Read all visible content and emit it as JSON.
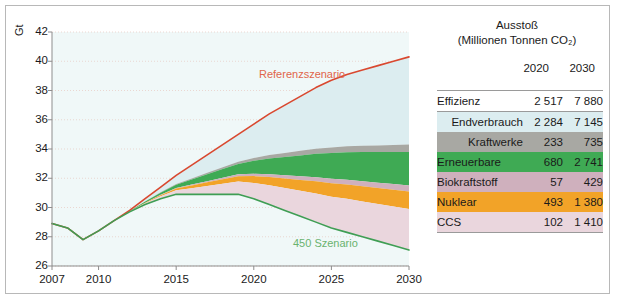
{
  "chart_data": {
    "type": "area",
    "title": "",
    "xlabel": "",
    "ylabel": "Gt",
    "xlim": [
      2007,
      2030
    ],
    "ylim": [
      26,
      42
    ],
    "grid": true,
    "legend_position": "inline-annotations",
    "xticks": [
      "2007",
      "2010",
      "2015",
      "2020",
      "2025",
      "2030"
    ],
    "yticks": [
      "42",
      "40",
      "38",
      "36",
      "34",
      "32",
      "30",
      "28",
      "26"
    ],
    "annotations": [
      {
        "text": "Referenzszenario",
        "color": "#e0654a"
      },
      {
        "text": "450 Szenario",
        "color": "#6ab36f"
      }
    ],
    "x": [
      2007,
      2008,
      2009,
      2010,
      2011,
      2012,
      2013,
      2014,
      2015,
      2016,
      2017,
      2018,
      2019,
      2020,
      2021,
      2022,
      2023,
      2024,
      2025,
      2026,
      2027,
      2028,
      2029,
      2030
    ],
    "series": [
      {
        "name": "Referenzszenario",
        "color": "#d9482f",
        "values": [
          28.9,
          28.6,
          27.8,
          28.4,
          29.1,
          29.8,
          30.6,
          31.4,
          32.2,
          32.9,
          33.6,
          34.3,
          35.0,
          35.7,
          36.4,
          37.0,
          37.6,
          38.2,
          38.7,
          39.1,
          39.4,
          39.7,
          40.0,
          40.3
        ]
      },
      {
        "name": "450 Szenario",
        "color": "#3f9e54",
        "values": [
          28.9,
          28.6,
          27.8,
          28.4,
          29.1,
          29.7,
          30.2,
          30.6,
          30.9,
          30.9,
          30.9,
          30.9,
          30.9,
          30.6,
          30.2,
          29.8,
          29.4,
          29.0,
          28.6,
          28.3,
          28.0,
          27.7,
          27.4,
          27.1
        ]
      }
    ],
    "bands": [
      {
        "name": "Endverbrauch",
        "color": "#dcedf0",
        "top_2030": 40.3,
        "bottom_2030": 34.3
      },
      {
        "name": "Kraftwerke",
        "color": "#a8a8a3",
        "top_2030": 34.3,
        "bottom_2030": 33.8
      },
      {
        "name": "Erneuerbare",
        "color": "#3faa54",
        "top_2030": 33.8,
        "bottom_2030": 31.5
      },
      {
        "name": "Biokraftstoff",
        "color": "#cfb0bd",
        "top_2030": 31.5,
        "bottom_2030": 31.1
      },
      {
        "name": "Nuklear",
        "color": "#f2a328",
        "top_2030": 31.1,
        "bottom_2030": 29.9
      },
      {
        "name": "CCS",
        "color": "#ead6dd",
        "top_2030": 29.9,
        "bottom_2030": 27.1
      }
    ]
  },
  "table": {
    "header": {
      "line1": "Ausstoß",
      "line2": "(Millionen Tonnen CO₂)",
      "col1": "2020",
      "col2": "2030"
    },
    "rows": [
      {
        "label": "Effizienz",
        "v2020": "2 517",
        "v2030": "7 880",
        "color": "#ffffff",
        "align": "left"
      },
      {
        "label": "Endverbrauch",
        "v2020": "2 284",
        "v2030": "7 145",
        "color": "#dcedf0",
        "align": "right"
      },
      {
        "label": "Kraftwerke",
        "v2020": "233",
        "v2030": "735",
        "color": "#a8a8a3",
        "align": "right"
      },
      {
        "label": "Erneuerbare",
        "v2020": "680",
        "v2030": "2 741",
        "color": "#3faa54",
        "align": "left"
      },
      {
        "label": "Biokraftstoff",
        "v2020": "57",
        "v2030": "429",
        "color": "#cfb0bd",
        "align": "left"
      },
      {
        "label": "Nuklear",
        "v2020": "493",
        "v2030": "1 380",
        "color": "#f2a328",
        "align": "left"
      },
      {
        "label": "CCS",
        "v2020": "102",
        "v2030": "1 410",
        "color": "#ead6dd",
        "align": "left"
      }
    ]
  }
}
